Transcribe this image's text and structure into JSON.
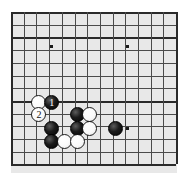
{
  "board": {
    "name": "go-board-diagram",
    "grid_color": "#4a4a4a",
    "edge_color": "#2a2a2a",
    "background_color": "#e8e8e8",
    "black_color": "#111111",
    "white_color": "#fafafa",
    "cols": 14,
    "rows": 13,
    "cell": 12.7,
    "origin_x": 11,
    "origin_y": 12,
    "thick_rows": [
      2,
      7,
      12
    ],
    "thick_cols": [
      0,
      13
    ],
    "star_points": [
      {
        "name": "star-point-upper-left",
        "col": 3.2,
        "row": 2.7
      },
      {
        "name": "star-point-upper-right",
        "col": 9.2,
        "row": 2.7
      },
      {
        "name": "star-point-center-right",
        "col": 9.2,
        "row": 9.2
      }
    ],
    "stones": [
      {
        "name": "white-stone-a",
        "color": "white",
        "col": 2.2,
        "row": 7.1,
        "label": ""
      },
      {
        "name": "black-stone-move-1",
        "color": "black",
        "col": 3.2,
        "row": 7.1,
        "label": "1"
      },
      {
        "name": "white-stone-move-2",
        "color": "white",
        "col": 2.2,
        "row": 8.1,
        "label": "2"
      },
      {
        "name": "black-stone-b",
        "color": "black",
        "col": 3.2,
        "row": 9.2,
        "label": ""
      },
      {
        "name": "black-stone-c",
        "color": "black",
        "col": 5.2,
        "row": 8.1,
        "label": ""
      },
      {
        "name": "white-stone-d",
        "color": "white",
        "col": 6.2,
        "row": 8.1,
        "label": ""
      },
      {
        "name": "black-stone-e",
        "color": "black",
        "col": 5.2,
        "row": 9.2,
        "label": ""
      },
      {
        "name": "white-stone-f",
        "color": "white",
        "col": 6.2,
        "row": 9.2,
        "label": ""
      },
      {
        "name": "black-stone-g",
        "color": "black",
        "col": 3.2,
        "row": 10.2,
        "label": ""
      },
      {
        "name": "white-stone-h",
        "color": "white",
        "col": 4.2,
        "row": 10.2,
        "label": ""
      },
      {
        "name": "white-stone-i",
        "color": "white",
        "col": 5.2,
        "row": 10.2,
        "label": ""
      },
      {
        "name": "black-stone-j",
        "color": "black",
        "col": 8.2,
        "row": 9.2,
        "label": ""
      }
    ]
  }
}
